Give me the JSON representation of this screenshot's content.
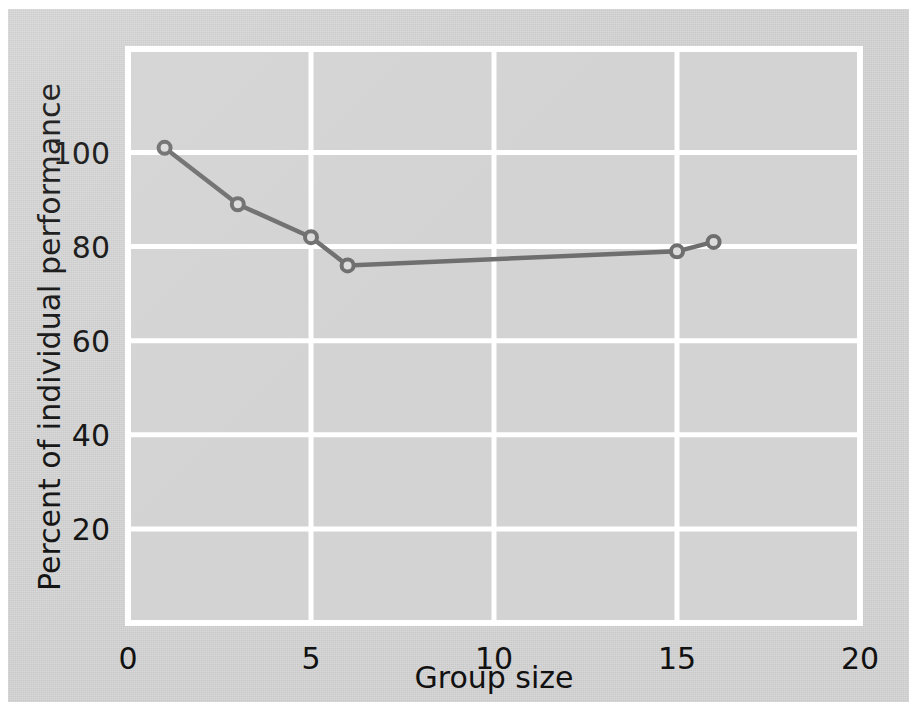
{
  "figure": {
    "background_color": "#c9c9c9",
    "plot_background_color": "#d2d2d2",
    "grid_color": "#ffffff",
    "series_color": "#6e6e6e",
    "marker_fill_color": "#dcdcdc",
    "text_color": "#111111"
  },
  "chart_data": {
    "type": "line",
    "title": "",
    "xlabel": "Group size",
    "ylabel": "Percent of individual performance",
    "xlim": [
      0,
      20
    ],
    "ylim": [
      0,
      122
    ],
    "xticks": [
      0,
      5,
      10,
      15,
      20
    ],
    "xtick_labels": [
      "0",
      "5",
      "10",
      "15",
      "20"
    ],
    "yticks": [
      20,
      40,
      60,
      80,
      100
    ],
    "ytick_labels": [
      "20",
      "40",
      "60",
      "80",
      "100"
    ],
    "grid": true,
    "grid_axes": "both",
    "legend": false,
    "legend_position": "none",
    "markers": "open-circle",
    "x": [
      1,
      3,
      5,
      6,
      15,
      16
    ],
    "values": [
      101,
      89,
      82,
      76,
      79,
      81
    ],
    "series": [
      {
        "name": "Percent of individual performance",
        "x": [
          1,
          3,
          5,
          6,
          15,
          16
        ],
        "values": [
          101,
          89,
          82,
          76,
          79,
          81
        ]
      }
    ],
    "annotations": []
  }
}
